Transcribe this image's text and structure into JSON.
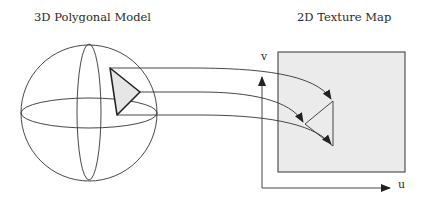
{
  "titles": {
    "left": "3D Polygonal Model",
    "right": "2D Texture Map"
  },
  "axes": {
    "v_label": "v",
    "u_label": "u"
  },
  "colors": {
    "stroke": "#333333",
    "texture_fill": "#ebebeb",
    "triangle_fill": "#e6e6e6"
  }
}
